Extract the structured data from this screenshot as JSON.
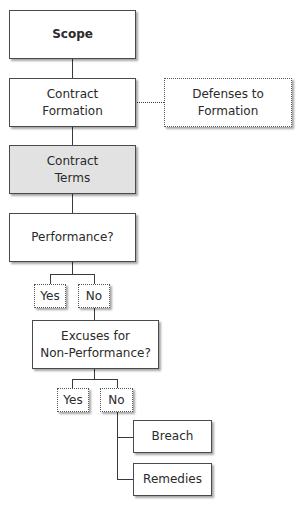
{
  "diagram": {
    "type": "flowchart",
    "nodes": {
      "scope": {
        "label": "Scope",
        "style": "bold"
      },
      "contract_formation": {
        "label": "Contract\nFormation"
      },
      "defenses_to_formation": {
        "label": "Defenses to\nFormation",
        "style": "dotted"
      },
      "contract_terms": {
        "label": "Contract\nTerms",
        "style": "shaded",
        "fill": "#e2e2e2"
      },
      "performance": {
        "label": "Performance?"
      },
      "performance_yes": {
        "label": "Yes",
        "style": "dotted"
      },
      "performance_no": {
        "label": "No",
        "style": "dotted"
      },
      "excuses": {
        "label": "Excuses for\nNon-Performance?"
      },
      "excuses_yes": {
        "label": "Yes",
        "style": "dotted"
      },
      "excuses_no": {
        "label": "No",
        "style": "dotted"
      },
      "breach": {
        "label": "Breach"
      },
      "remedies": {
        "label": "Remedies"
      }
    },
    "edges": [
      [
        "scope",
        "contract_formation"
      ],
      [
        "contract_formation",
        "defenses_to_formation"
      ],
      [
        "contract_formation",
        "contract_terms"
      ],
      [
        "contract_terms",
        "performance"
      ],
      [
        "performance",
        "performance_yes"
      ],
      [
        "performance",
        "performance_no"
      ],
      [
        "performance_no",
        "excuses"
      ],
      [
        "excuses",
        "excuses_yes"
      ],
      [
        "excuses",
        "excuses_no"
      ],
      [
        "excuses_no",
        "breach"
      ],
      [
        "excuses_no",
        "remedies"
      ]
    ]
  }
}
